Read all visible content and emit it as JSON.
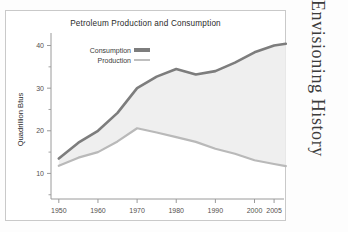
{
  "side_title": "Envisioning History",
  "figure": {
    "title": "Petroleum Production and Consumption",
    "y_axis_label": "Quadrillion Btus"
  },
  "legend": {
    "items": [
      {
        "label": "Consumption",
        "color": "#7d7d7d"
      },
      {
        "label": "Production",
        "color": "#b9b9b9"
      }
    ]
  },
  "colors": {
    "consumption_line": "#7d7d7d",
    "production_line": "#b9b9b9",
    "band_fill": "#efefef",
    "axis": "#9a9a9a",
    "frame": "#c9c9c9",
    "text": "#2b2b2b"
  },
  "axes": {
    "y_ticks": [
      "10",
      "20",
      "30",
      "40"
    ],
    "y_tick_values": [
      10,
      20,
      30,
      40
    ],
    "y_minor_values": [
      5,
      15,
      25,
      35
    ],
    "x_ticks": [
      "1950",
      "1960",
      "1970",
      "1980",
      "1990",
      "2000",
      "2005"
    ],
    "x_tick_values": [
      1950,
      1960,
      1970,
      1980,
      1990,
      2000,
      2005
    ]
  },
  "chart_data": {
    "type": "area",
    "title": "Petroleum Production and Consumption",
    "xlabel": "",
    "ylabel": "Quadrillion Btus",
    "xlim": [
      1948,
      2006
    ],
    "ylim": [
      4,
      42
    ],
    "grid": false,
    "legend_position": "top-left",
    "x": [
      1950,
      1955,
      1960,
      1965,
      1970,
      1975,
      1980,
      1985,
      1990,
      1995,
      2000,
      2005,
      2008
    ],
    "series": [
      {
        "name": "Consumption",
        "color": "#7d7d7d",
        "values": [
          13.5,
          17.2,
          20.0,
          24.2,
          30.0,
          32.7,
          34.5,
          33.2,
          34.0,
          36.0,
          38.4,
          40.0,
          40.4
        ]
      },
      {
        "name": "Production",
        "color": "#b9b9b9",
        "values": [
          11.8,
          13.7,
          15.0,
          17.5,
          20.6,
          19.6,
          18.5,
          17.4,
          15.8,
          14.6,
          13.1,
          12.2,
          11.7
        ]
      }
    ],
    "annotations": [
      "Shaded band between the two curves represents net petroleum imports."
    ]
  }
}
